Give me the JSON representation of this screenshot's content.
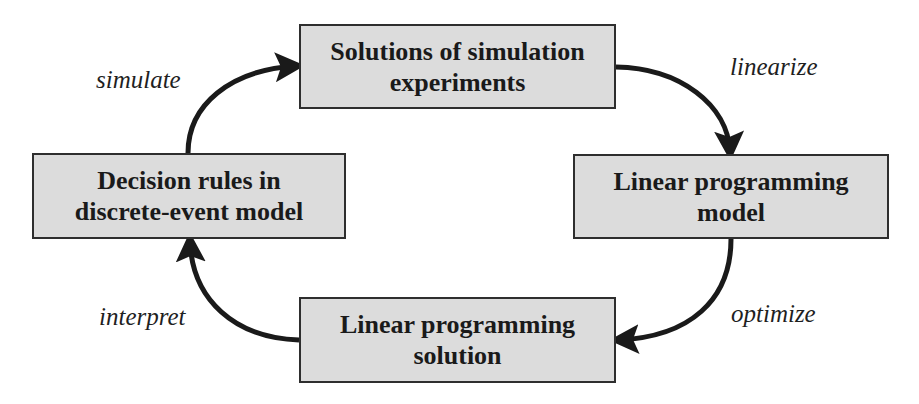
{
  "diagram": {
    "type": "cycle",
    "nodes": [
      {
        "id": "top",
        "line1": "Solutions of simulation",
        "line2": "experiments"
      },
      {
        "id": "right",
        "line1": "Linear programming",
        "line2": "model"
      },
      {
        "id": "bottom",
        "line1": "Linear programming",
        "line2": "solution"
      },
      {
        "id": "left",
        "line1": "Decision rules in",
        "line2": "discrete-event model"
      }
    ],
    "edges": [
      {
        "from": "left",
        "to": "top",
        "label": "simulate"
      },
      {
        "from": "top",
        "to": "right",
        "label": "linearize"
      },
      {
        "from": "right",
        "to": "bottom",
        "label": "optimize"
      },
      {
        "from": "bottom",
        "to": "left",
        "label": "interpret"
      }
    ]
  },
  "colors": {
    "box_fill": "#dcdcdc",
    "box_border": "#2e2e2e",
    "arrow": "#1a1a1a",
    "text": "#1a1a1a"
  }
}
